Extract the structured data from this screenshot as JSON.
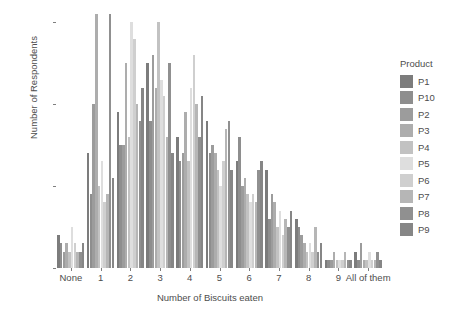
{
  "chart_data": {
    "type": "bar",
    "title": "",
    "subtitle": "",
    "xlabel": "Number of Biscuits eaten",
    "ylabel": "Number of Respondents",
    "categories": [
      "None",
      "1",
      "2",
      "3",
      "4",
      "5",
      "6",
      "7",
      "8",
      "9",
      "All of them"
    ],
    "ylim": [
      0,
      31
    ],
    "yticks": [
      0,
      10,
      20,
      30
    ],
    "ytick_labels": [
      "0",
      "10",
      "20",
      "30"
    ],
    "grid": false,
    "legend_position": "right",
    "legend_title": "Product",
    "series": [
      {
        "name": "P1",
        "color": "#7c7c7c",
        "values": [
          4,
          14,
          19,
          25,
          16,
          18,
          13,
          12,
          6,
          1,
          2
        ]
      },
      {
        "name": "P10",
        "color": "#8e8e8e",
        "values": [
          3,
          9,
          15,
          18,
          13,
          14,
          16,
          6,
          5,
          1,
          1
        ]
      },
      {
        "name": "P2",
        "color": "#9c9c9c",
        "values": [
          2,
          20,
          15,
          26,
          14,
          15,
          10,
          9,
          4,
          1,
          3
        ]
      },
      {
        "name": "P3",
        "color": "#adadad",
        "values": [
          3,
          31,
          25,
          22,
          19,
          14,
          11,
          8,
          3,
          2,
          1
        ]
      },
      {
        "name": "P4",
        "color": "#c2c2c2",
        "values": [
          2,
          10,
          16,
          30,
          13,
          12,
          9,
          5,
          2,
          1,
          1
        ]
      },
      {
        "name": "P5",
        "color": "#dedede",
        "values": [
          5,
          13,
          30,
          23,
          22,
          10,
          8,
          7,
          3,
          1,
          2
        ]
      },
      {
        "name": "P6",
        "color": "#cfcfcf",
        "values": [
          3,
          8,
          28,
          21,
          26,
          13,
          9,
          4,
          2,
          1,
          1
        ]
      },
      {
        "name": "P7",
        "color": "#b6b6b6",
        "values": [
          2,
          9,
          20,
          16,
          20,
          17,
          8,
          6,
          5,
          2,
          1
        ]
      },
      {
        "name": "P8",
        "color": "#909090",
        "values": [
          2,
          31,
          18,
          25,
          16,
          18,
          12,
          5,
          2,
          1,
          2
        ]
      },
      {
        "name": "P9",
        "color": "#868686",
        "values": [
          3,
          11,
          22,
          14,
          21,
          12,
          13,
          7,
          3,
          1,
          1
        ]
      }
    ]
  },
  "axes": {
    "y_title": "Number of Respondents",
    "x_title": "Number of Biscuits eaten"
  },
  "legend": {
    "title": "Product",
    "items": [
      {
        "label": "P1"
      },
      {
        "label": "P10"
      },
      {
        "label": "P2"
      },
      {
        "label": "P3"
      },
      {
        "label": "P4"
      },
      {
        "label": "P5"
      },
      {
        "label": "P6"
      },
      {
        "label": "P7"
      },
      {
        "label": "P8"
      },
      {
        "label": "P9"
      }
    ]
  },
  "colors": {
    "background": "#ffffff",
    "text": "#4d4d4d",
    "axis": "#7f7f7f"
  }
}
